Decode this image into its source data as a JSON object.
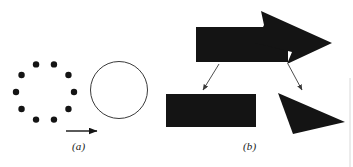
{
  "figure": {
    "background_color": "#ffffff",
    "ink_color": "#141414",
    "stroke_color": "#3a3a3a",
    "panels": [
      {
        "id": "a",
        "label": "(a)",
        "label_position": {
          "x": 72,
          "y": 140
        },
        "description": "dot-ring-and-circle",
        "dot_ring": {
          "name": "dot-ring",
          "center": {
            "x": 45,
            "y": 92
          },
          "radius": 29,
          "dot_radius": 3.2,
          "count": 10,
          "start_angle_deg": -108,
          "color": "#141414"
        },
        "circle": {
          "name": "outline-circle",
          "center": {
            "x": 119,
            "y": 90
          },
          "radius": 28.5,
          "stroke": "#3a3a3a",
          "stroke_width": 1,
          "fill": "none"
        },
        "transform_arrow": {
          "name": "transform-arrow",
          "from": {
            "x": 66,
            "y": 131
          },
          "to": {
            "x": 99,
            "y": 131
          },
          "color": "#141414"
        }
      },
      {
        "id": "b",
        "label": "(b)",
        "label_position": {
          "x": 243,
          "y": 140
        },
        "description": "arrow-decomposed-into-rectangle-and-triangle",
        "composite_arrow": {
          "name": "composite-arrow-shape",
          "fill": "#141414",
          "body_points": "196,27 288,27 288,62 196,62",
          "head_points": "261,11 332,43 287,64 292,52 255,43 264,25"
        },
        "part_rectangle": {
          "name": "decomposed-rectangle",
          "fill": "#141414",
          "x": 166,
          "y": 94,
          "width": 90,
          "height": 33
        },
        "part_triangle": {
          "name": "decomposed-triangle",
          "fill": "#141414",
          "points": "278,93 345,122 293,134"
        },
        "connector_left": {
          "name": "connector-arrow-left",
          "from": {
            "x": 219,
            "y": 64
          },
          "to": {
            "x": 203,
            "y": 92
          },
          "color": "#3a3a3a"
        },
        "connector_right": {
          "name": "connector-arrow-right",
          "from": {
            "x": 288,
            "y": 64
          },
          "to": {
            "x": 302,
            "y": 92
          },
          "color": "#3a3a3a"
        }
      }
    ],
    "edge_artifact": {
      "name": "scan-edge-line",
      "x": 350,
      "y_top": 78,
      "y_bottom": 167,
      "color": "#d8d8d8"
    }
  }
}
